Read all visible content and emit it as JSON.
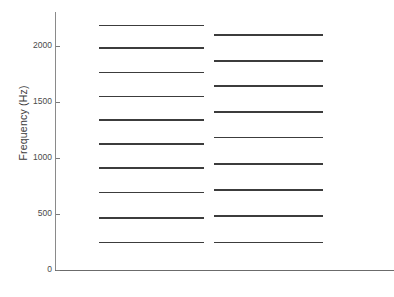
{
  "chart_data": {
    "type": "line",
    "title": "",
    "subtitle": "",
    "xlabel": "",
    "ylabel": "Frequency (Hz)",
    "ylim": [
      0,
      2300
    ],
    "xlim": [
      0,
      1
    ],
    "grid": false,
    "legend": "none",
    "y_ticks": [
      {
        "value": 0,
        "label": "0"
      },
      {
        "value": 500,
        "label": "500"
      },
      {
        "value": 1000,
        "label": "1000"
      },
      {
        "value": 1500,
        "label": "1500"
      },
      {
        "value": 2000,
        "label": "2000"
      }
    ],
    "x_ticks": [],
    "series": [
      {
        "name": "series-left",
        "style": "horizontal-levels",
        "x_start": 0.13,
        "x_end": 0.44,
        "values": [
          245,
          465,
          690,
          910,
          1125,
          1335,
          1545,
          1760,
          1980,
          2180
        ]
      },
      {
        "name": "series-right",
        "style": "horizontal-levels",
        "x_start": 0.47,
        "x_end": 0.79,
        "values": [
          245,
          480,
          715,
          945,
          1180,
          1410,
          1640,
          1865,
          2095
        ]
      }
    ],
    "annotations": []
  },
  "figure": {
    "background_color": "#ffffff",
    "line_color": "#3c3c3c",
    "axis_color": "#7a7a7a",
    "tick_label_color": "#4a4a4a"
  }
}
